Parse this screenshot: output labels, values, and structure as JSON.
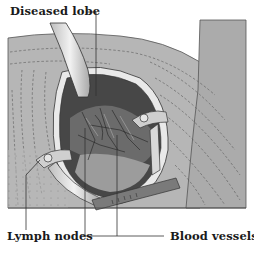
{
  "figure": {
    "labels": {
      "diseased_lobe": "Diseased lobe",
      "lymph_nodes": "Lymph nodes",
      "blood_vessels": "Blood vessels"
    },
    "colors": {
      "drape": "#b5b5b5",
      "drape_dark": "#9a9a9a",
      "cavity_dark": "#3d3d3d",
      "tissue_mid": "#6e6e6e",
      "retractor_light": "#e4e4e4",
      "line": "#2a2a2a",
      "background": "#ffffff"
    }
  }
}
